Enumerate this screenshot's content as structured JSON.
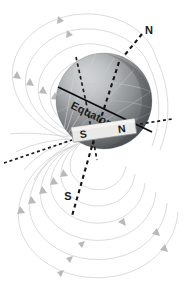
{
  "figure": {
    "kind": "earth-magnetic-field-diagram",
    "background_color": "#ffffff",
    "width": 190,
    "height": 292
  },
  "labels": {
    "geographic_north": "N",
    "geographic_south": "S",
    "equator": "Equator",
    "magnet_south_pole": "S",
    "magnet_north_pole": "N"
  },
  "earth": {
    "center_x": 104,
    "center_y": 101,
    "radius": 48,
    "fill_light": "#b9bcbe",
    "fill_mid": "#8d9193",
    "fill_dark": "#4a4d50",
    "meridian_color": "#cfd2d4"
  },
  "bar_magnet": {
    "label_left": "S",
    "label_right": "N",
    "fill": "#e8e8e6",
    "border_color": "#8e8e92",
    "rotation_deg": -8
  },
  "magnetic_axis": {
    "style": "dashed",
    "color": "#151515",
    "north_end_label": "N",
    "south_end_label": "S"
  },
  "field_lines": {
    "color": "#d2d2d4",
    "arrow_color": "#b9b9bd",
    "style": "solid-thin-with-arrowheads",
    "loop_count_upper": 5,
    "loop_count_lower": 5
  },
  "equator_line": {
    "color": "#0e0e0e",
    "style": "solid",
    "text_rotation_deg": 27
  }
}
